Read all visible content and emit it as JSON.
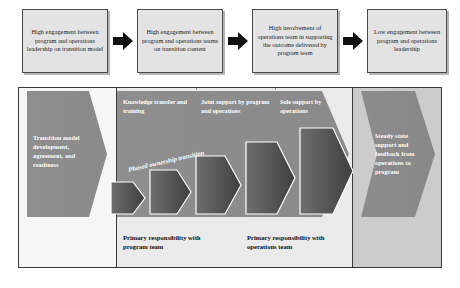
{
  "diagram": {
    "title_flow": [
      {
        "id": "box1",
        "text": "High engagement between program and operations leadership on transition model"
      },
      {
        "id": "box2",
        "text": "High engagement between program and operations teams on transition content"
      },
      {
        "id": "box3",
        "text": "High involvement of operations team in supporting the outcome delivered by program team"
      },
      {
        "id": "box4",
        "text": "Low engagement between program and operations leadership"
      }
    ],
    "arrows": [
      {
        "id": "arrow1",
        "icon": "right-arrow-icon"
      },
      {
        "id": "arrow2",
        "icon": "right-arrow-icon"
      },
      {
        "id": "arrow3",
        "icon": "right-arrow-icon"
      }
    ],
    "panels": {
      "left": {
        "shape_label": "Transition model development, agreement, and readiness"
      },
      "middle": {
        "column_headers": [
          "Knowledge transfer and training",
          "Joint support by program and operations",
          "Sole support by operations"
        ],
        "transition_label": "Phased ownership transition",
        "footer_left": "Primary responsibility with program team",
        "footer_right": "Primary responsibility with operations team",
        "steps": [
          {
            "index": 1,
            "height_pct": 30
          },
          {
            "index": 2,
            "height_pct": 45
          },
          {
            "index": 3,
            "height_pct": 62
          },
          {
            "index": 4,
            "height_pct": 80
          },
          {
            "index": 5,
            "height_pct": 100
          }
        ]
      },
      "right": {
        "shape_label": "Steady state support and feedback from operations to program"
      }
    },
    "colors": {
      "box_fill": "#e3e3e3",
      "box_border": "#4a4a4a",
      "arrow_black": "#111111",
      "panel_left_bg": "#f6f6f6",
      "panel_mid_bg": "#eaeaea",
      "panel_right_bg": "#cccccc",
      "band_gray": "#8b8b8b",
      "step_dark": "#4d4d4d",
      "outline_white": "#ffffff"
    }
  }
}
